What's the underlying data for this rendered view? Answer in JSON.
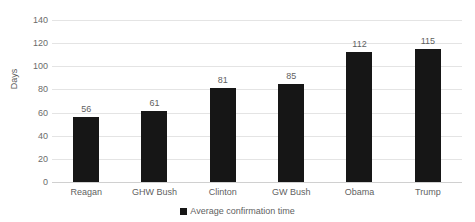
{
  "chart_data": {
    "type": "bar",
    "title": "",
    "subtitle": "",
    "xlabel": "",
    "ylabel": "Days",
    "categories": [
      "Reagan",
      "GHW Bush",
      "Clinton",
      "GW Bush",
      "Obama",
      "Trump"
    ],
    "values": [
      56,
      61,
      81,
      85,
      112,
      115
    ],
    "series": [
      {
        "name": "Average confirmation time",
        "values": [
          56,
          61,
          81,
          85,
          112,
          115
        ],
        "color": "#161616"
      }
    ],
    "ylim": [
      0,
      140
    ],
    "y_ticks": [
      0,
      20,
      40,
      60,
      80,
      100,
      120,
      140
    ],
    "y_tick_labels": [
      "0",
      "20",
      "40",
      "60",
      "80",
      "100",
      "120",
      "140"
    ],
    "data_labels": [
      "56",
      "61",
      "81",
      "85",
      "112",
      "115"
    ],
    "grid": true,
    "grid_axis": "y",
    "legend": {
      "position": "bottom",
      "entries": [
        {
          "label": "Average confirmation time",
          "color": "#161616",
          "marker": "square"
        }
      ]
    },
    "colors": {
      "bar": "#161616",
      "gridline": "#e4e4e4",
      "baseline": "#d0d0d0",
      "text": "#5f5f5f",
      "tick_text": "#6b6b6b",
      "background": "#ffffff"
    }
  }
}
